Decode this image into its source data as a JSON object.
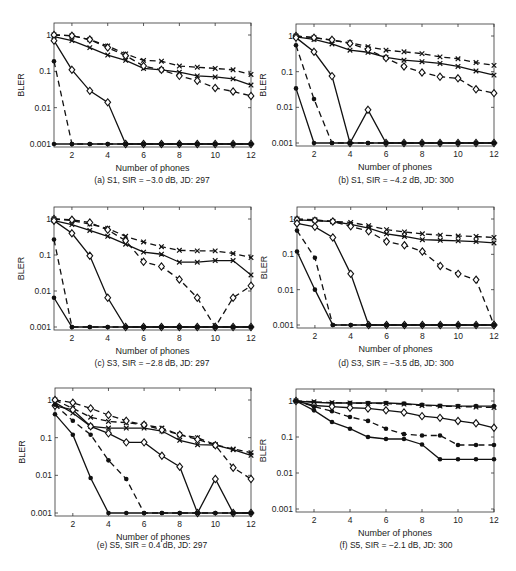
{
  "chart_data": [
    {
      "id": "a",
      "type": "line",
      "caption": "(a) S1, SIR = −3.0 dB, JD: 297",
      "xlabel": "Number of phones",
      "ylabel": "BLER",
      "yscale": "log",
      "ylim": [
        0.001,
        1
      ],
      "xlim": [
        1,
        12
      ],
      "xticks": [
        2,
        4,
        6,
        8,
        10,
        12
      ],
      "yticks": [
        {
          "v": 1,
          "label": "1"
        },
        {
          "v": 0.1,
          "label": "0.1"
        },
        {
          "v": 0.01,
          "label": "0.01"
        },
        {
          "v": 0.001,
          "label": "0.001"
        }
      ],
      "x": [
        1,
        2,
        3,
        4,
        5,
        6,
        7,
        8,
        9,
        10,
        11,
        12
      ],
      "series": [
        {
          "name": "solid-x",
          "style": "solid",
          "marker": "x",
          "values": [
            0.9,
            0.7,
            0.45,
            0.28,
            0.2,
            0.12,
            0.11,
            0.095,
            0.075,
            0.07,
            0.062,
            0.042
          ]
        },
        {
          "name": "dashed-x",
          "style": "dashed",
          "marker": "x",
          "values": [
            1.0,
            0.95,
            0.75,
            0.5,
            0.3,
            0.2,
            0.19,
            0.14,
            0.13,
            0.12,
            0.11,
            0.082
          ]
        },
        {
          "name": "dashed-diamond",
          "style": "dashed",
          "marker": "diamond",
          "values": [
            1.0,
            0.95,
            0.75,
            0.45,
            0.27,
            0.14,
            0.11,
            0.075,
            0.055,
            0.035,
            0.028,
            0.021
          ]
        },
        {
          "name": "solid-diamond",
          "style": "solid",
          "marker": "diamond",
          "values": [
            0.7,
            0.11,
            0.029,
            0.014,
            0.001,
            0.001,
            0.001,
            0.001,
            0.001,
            0.001,
            0.001,
            0.001
          ]
        },
        {
          "name": "dashed-dot",
          "style": "dashed",
          "marker": "dot",
          "values": [
            0.19,
            0.001,
            0.001,
            0.001,
            0.001,
            0.001,
            0.001,
            0.001,
            0.001,
            0.001,
            0.001,
            0.001
          ]
        },
        {
          "name": "solid-dot",
          "style": "solid",
          "marker": "dot",
          "values": [
            0.001,
            0.001,
            0.001,
            0.001,
            0.001,
            0.001,
            0.001,
            0.001,
            0.001,
            0.001,
            0.001,
            0.001
          ]
        }
      ]
    },
    {
      "id": "b",
      "type": "line",
      "caption": "(b) S1, SIR = −4.2 dB, JD: 300",
      "xlabel": "Number of phones",
      "ylabel": "BLER",
      "yscale": "log",
      "ylim": [
        0.001,
        1
      ],
      "xlim": [
        1,
        12
      ],
      "xticks": [
        2,
        4,
        6,
        8,
        10,
        12
      ],
      "yticks": [
        {
          "v": 1,
          "label": "1"
        },
        {
          "v": 0.1,
          "label": "0.1"
        },
        {
          "v": 0.01,
          "label": "0.01"
        },
        {
          "v": 0.001,
          "label": "0.001"
        }
      ],
      "x": [
        1,
        2,
        3,
        4,
        5,
        6,
        7,
        8,
        9,
        10,
        11,
        12
      ],
      "series": [
        {
          "name": "solid-x",
          "style": "solid",
          "marker": "x",
          "values": [
            0.95,
            0.8,
            0.6,
            0.4,
            0.35,
            0.25,
            0.21,
            0.19,
            0.17,
            0.14,
            0.105,
            0.08
          ]
        },
        {
          "name": "dashed-x",
          "style": "dashed",
          "marker": "x",
          "values": [
            1.0,
            0.9,
            0.75,
            0.65,
            0.5,
            0.4,
            0.36,
            0.32,
            0.26,
            0.23,
            0.18,
            0.15
          ]
        },
        {
          "name": "dashed-diamond",
          "style": "dashed",
          "marker": "diamond",
          "values": [
            1.0,
            0.9,
            0.78,
            0.62,
            0.42,
            0.24,
            0.14,
            0.095,
            0.072,
            0.065,
            0.032,
            0.025
          ]
        },
        {
          "name": "solid-diamond",
          "style": "solid",
          "marker": "diamond",
          "values": [
            0.9,
            0.36,
            0.075,
            0.001,
            0.0085,
            0.001,
            0.001,
            0.001,
            0.001,
            0.001,
            0.001,
            0.001
          ]
        },
        {
          "name": "dashed-dot",
          "style": "dashed",
          "marker": "dot",
          "values": [
            0.55,
            0.017,
            0.001,
            0.001,
            0.001,
            0.001,
            0.001,
            0.001,
            0.001,
            0.001,
            0.001,
            0.001
          ]
        },
        {
          "name": "solid-dot",
          "style": "solid",
          "marker": "dot",
          "values": [
            0.034,
            0.001,
            0.001,
            0.001,
            0.001,
            0.001,
            0.001,
            0.001,
            0.001,
            0.001,
            0.001,
            0.001
          ]
        }
      ]
    },
    {
      "id": "c",
      "type": "line",
      "caption": "(c) S3, SIR = −2.8 dB, JD: 297",
      "xlabel": "Number of phones",
      "ylabel": "BLER",
      "yscale": "log",
      "ylim": [
        0.001,
        1
      ],
      "xlim": [
        1,
        12
      ],
      "xticks": [
        2,
        4,
        6,
        8,
        10,
        12
      ],
      "yticks": [
        {
          "v": 1,
          "label": "1"
        },
        {
          "v": 0.1,
          "label": "0.1"
        },
        {
          "v": 0.01,
          "label": "0.01"
        },
        {
          "v": 0.001,
          "label": "0.001"
        }
      ],
      "x": [
        1,
        2,
        3,
        4,
        5,
        6,
        7,
        8,
        9,
        10,
        11,
        12
      ],
      "series": [
        {
          "name": "solid-x",
          "style": "solid",
          "marker": "x",
          "values": [
            0.9,
            0.7,
            0.48,
            0.33,
            0.2,
            0.12,
            0.105,
            0.063,
            0.063,
            0.07,
            0.07,
            0.028
          ]
        },
        {
          "name": "dashed-x",
          "style": "dashed",
          "marker": "x",
          "values": [
            1.0,
            0.9,
            0.72,
            0.55,
            0.33,
            0.23,
            0.17,
            0.135,
            0.13,
            0.13,
            0.11,
            0.085
          ]
        },
        {
          "name": "dashed-diamond",
          "style": "dashed",
          "marker": "diamond",
          "values": [
            1.0,
            0.95,
            0.8,
            0.5,
            0.25,
            0.065,
            0.048,
            0.021,
            0.0065,
            0.001,
            0.0065,
            0.014
          ]
        },
        {
          "name": "solid-diamond",
          "style": "solid",
          "marker": "diamond",
          "values": [
            0.9,
            0.4,
            0.095,
            0.0065,
            0.001,
            0.001,
            0.001,
            0.001,
            0.001,
            0.001,
            0.001,
            0.001
          ]
        },
        {
          "name": "dashed-dot",
          "style": "dashed",
          "marker": "dot",
          "values": [
            0.27,
            0.001,
            0.001,
            0.001,
            0.001,
            0.001,
            0.001,
            0.001,
            0.001,
            0.001,
            0.001,
            0.001
          ]
        },
        {
          "name": "solid-dot",
          "style": "solid",
          "marker": "dot",
          "values": [
            0.0065,
            0.001,
            0.001,
            0.001,
            0.001,
            0.001,
            0.001,
            0.001,
            0.001,
            0.001,
            0.001,
            0.001
          ]
        }
      ]
    },
    {
      "id": "d",
      "type": "line",
      "caption": "(d) S3, SIR = −3.5 dB, JD: 300",
      "xlabel": "Number of phones",
      "ylabel": "BLER",
      "yscale": "log",
      "ylim": [
        0.001,
        1
      ],
      "xlim": [
        1,
        12
      ],
      "xticks": [
        2,
        4,
        6,
        8,
        10,
        12
      ],
      "yticks": [
        {
          "v": 1,
          "label": "1"
        },
        {
          "v": 0.1,
          "label": "0.1"
        },
        {
          "v": 0.01,
          "label": "0.01"
        },
        {
          "v": 0.001,
          "label": "0.001"
        }
      ],
      "x": [
        1,
        2,
        3,
        4,
        5,
        6,
        7,
        8,
        9,
        10,
        11,
        12
      ],
      "series": [
        {
          "name": "solid-x",
          "style": "solid",
          "marker": "x",
          "values": [
            0.95,
            0.9,
            0.85,
            0.7,
            0.55,
            0.38,
            0.32,
            0.26,
            0.25,
            0.24,
            0.23,
            0.21
          ]
        },
        {
          "name": "dashed-x",
          "style": "dashed",
          "marker": "x",
          "values": [
            1.0,
            0.95,
            0.85,
            0.8,
            0.65,
            0.5,
            0.43,
            0.38,
            0.35,
            0.33,
            0.32,
            0.3
          ]
        },
        {
          "name": "dashed-diamond",
          "style": "dashed",
          "marker": "diamond",
          "values": [
            0.95,
            0.9,
            0.85,
            0.62,
            0.45,
            0.23,
            0.18,
            0.12,
            0.047,
            0.028,
            0.019,
            0.001
          ]
        },
        {
          "name": "solid-diamond",
          "style": "solid",
          "marker": "diamond",
          "values": [
            0.75,
            0.6,
            0.3,
            0.028,
            0.001,
            0.001,
            0.001,
            0.001,
            0.001,
            0.001,
            0.001,
            0.001
          ]
        },
        {
          "name": "dashed-dot",
          "style": "dashed",
          "marker": "dot",
          "values": [
            0.47,
            0.08,
            0.001,
            0.001,
            0.001,
            0.001,
            0.001,
            0.001,
            0.001,
            0.001,
            0.001,
            0.001
          ]
        },
        {
          "name": "solid-dot",
          "style": "solid",
          "marker": "dot",
          "values": [
            0.12,
            0.01,
            0.001,
            0.001,
            0.001,
            0.001,
            0.001,
            0.001,
            0.001,
            0.001,
            0.001,
            0.001
          ]
        }
      ]
    },
    {
      "id": "e",
      "type": "line",
      "caption": "(e) S5, SIR = 0.4 dB, JD: 297",
      "xlabel": "Number of phones",
      "ylabel": "BLER",
      "yscale": "log",
      "ylim": [
        0.001,
        1
      ],
      "xlim": [
        1,
        12
      ],
      "xticks": [
        2,
        4,
        6,
        8,
        10,
        12
      ],
      "yticks": [
        {
          "v": 1,
          "label": "1"
        },
        {
          "v": 0.1,
          "label": "0.1"
        },
        {
          "v": 0.01,
          "label": "0.01"
        },
        {
          "v": 0.001,
          "label": "0.001"
        }
      ],
      "x": [
        1,
        2,
        3,
        4,
        5,
        6,
        7,
        8,
        9,
        10,
        11,
        12
      ],
      "series": [
        {
          "name": "solid-x",
          "style": "solid",
          "marker": "x",
          "values": [
            0.85,
            0.45,
            0.2,
            0.18,
            0.18,
            0.18,
            0.15,
            0.085,
            0.065,
            0.063,
            0.048,
            0.034
          ]
        },
        {
          "name": "dashed-x",
          "style": "dashed",
          "marker": "x",
          "values": [
            1.0,
            0.6,
            0.35,
            0.27,
            0.25,
            0.22,
            0.18,
            0.12,
            0.1,
            0.065,
            0.05,
            0.04
          ]
        },
        {
          "name": "dashed-diamond",
          "style": "dashed",
          "marker": "diamond",
          "values": [
            1.0,
            0.85,
            0.6,
            0.4,
            0.28,
            0.22,
            0.16,
            0.12,
            0.09,
            0.063,
            0.016,
            0.008
          ]
        },
        {
          "name": "solid-diamond",
          "style": "solid",
          "marker": "diamond",
          "values": [
            0.7,
            0.55,
            0.2,
            0.13,
            0.075,
            0.075,
            0.033,
            0.017,
            0.001,
            0.008,
            0.001,
            0.001
          ]
        },
        {
          "name": "dashed-dot",
          "style": "dashed",
          "marker": "dot",
          "values": [
            0.75,
            0.28,
            0.12,
            0.025,
            0.008,
            0.001,
            0.001,
            0.001,
            0.001,
            0.001,
            0.001,
            0.001
          ]
        },
        {
          "name": "solid-dot",
          "style": "solid",
          "marker": "dot",
          "values": [
            0.42,
            0.12,
            0.0085,
            0.001,
            0.001,
            0.001,
            0.001,
            0.001,
            0.001,
            0.001,
            0.001,
            0.001
          ]
        }
      ]
    },
    {
      "id": "f",
      "type": "line",
      "caption": "(f) S5, SIR = −2.1 dB, JD: 300",
      "xlabel": "Number of phones",
      "ylabel": "BLER",
      "yscale": "log",
      "ylim": [
        0.001,
        1
      ],
      "xlim": [
        1,
        12
      ],
      "xticks": [
        2,
        4,
        6,
        8,
        10,
        12
      ],
      "yticks": [
        {
          "v": 1,
          "label": "1"
        },
        {
          "v": 0.1,
          "label": "0.1"
        },
        {
          "v": 0.01,
          "label": "0.01"
        },
        {
          "v": 0.001,
          "label": "0.001"
        }
      ],
      "x": [
        1,
        2,
        3,
        4,
        5,
        6,
        7,
        8,
        9,
        10,
        11,
        12
      ],
      "series": [
        {
          "name": "solid-dot-top",
          "style": "solid",
          "marker": "dot",
          "values": [
            1.0,
            0.92,
            0.88,
            0.88,
            0.88,
            0.88,
            0.85,
            0.78,
            0.74,
            0.72,
            0.72,
            0.72
          ]
        },
        {
          "name": "dashed-x",
          "style": "dashed",
          "marker": "x",
          "values": [
            1.0,
            0.95,
            0.9,
            0.88,
            0.86,
            0.85,
            0.82,
            0.75,
            0.72,
            0.7,
            0.68,
            0.66
          ]
        },
        {
          "name": "solid-diamond",
          "style": "solid",
          "marker": "diamond",
          "values": [
            1.0,
            0.75,
            0.7,
            0.65,
            0.62,
            0.55,
            0.48,
            0.38,
            0.34,
            0.28,
            0.24,
            0.18
          ]
        },
        {
          "name": "dashed-dot",
          "style": "dashed",
          "marker": "dot",
          "values": [
            1.0,
            0.7,
            0.52,
            0.36,
            0.28,
            0.17,
            0.12,
            0.11,
            0.11,
            0.06,
            0.06,
            0.06
          ]
        },
        {
          "name": "solid-dot",
          "style": "solid",
          "marker": "dot",
          "values": [
            1.0,
            0.55,
            0.26,
            0.17,
            0.1,
            0.088,
            0.088,
            0.062,
            0.024,
            0.024,
            0.024,
            0.024
          ]
        }
      ]
    }
  ]
}
